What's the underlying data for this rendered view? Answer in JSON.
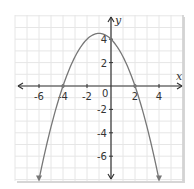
{
  "chart_data": {
    "type": "line",
    "title": "",
    "xlabel": "x",
    "ylabel": "y",
    "xlim": [
      -7.9,
      6.0
    ],
    "ylim": [
      -8.0,
      6.0
    ],
    "grid": true,
    "x_ticks": [
      -6,
      -4,
      -2,
      2,
      4
    ],
    "y_ticks": [
      4,
      2,
      -2,
      -4,
      -6
    ],
    "origin_label": "0",
    "series": [
      {
        "name": "parabola",
        "equation": "y = -0.5(x + 4)(x - 2)",
        "x": [
          -6,
          -5,
          -4,
          -3,
          -2,
          -1,
          0,
          1,
          2,
          3,
          4
        ],
        "y": [
          -8,
          -3.5,
          0,
          2.5,
          4,
          4.5,
          4,
          2.5,
          0,
          -3.5,
          -8
        ],
        "endpoints_arrows": true,
        "roots": [
          -4,
          2
        ],
        "vertex": [
          -1,
          4.5
        ],
        "y_intercept": 4
      }
    ]
  },
  "colors": {
    "grid": "#e6e6e6",
    "axis": "#333333",
    "curve": "#777777",
    "frame_shadow": "#d0d0d0"
  }
}
